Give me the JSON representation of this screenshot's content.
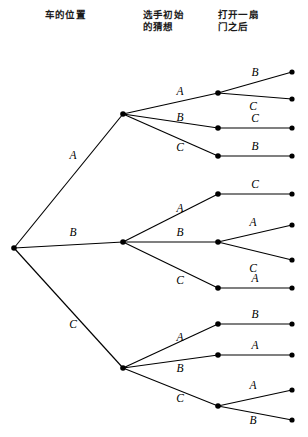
{
  "figure": {
    "width": 308,
    "height": 437,
    "background": "#ffffff",
    "line_color": "#000000",
    "node_color": "#000000"
  },
  "headers": [
    {
      "id": "hdr0",
      "text": "车的位置"
    },
    {
      "id": "hdr1",
      "text": "选手初始\n的猜想"
    },
    {
      "id": "hdr2",
      "text": "打开一扇\n门之后"
    }
  ],
  "chart_data": {
    "type": "diagram",
    "diagram_kind": "probability-tree",
    "levels": [
      "车的位置",
      "选手初始的猜想",
      "打开一扇门之后"
    ],
    "root": {
      "id": "root",
      "x": 14,
      "y": 248
    },
    "nodes": [
      {
        "id": "root",
        "x": 14,
        "y": 248,
        "level": 0,
        "label": ""
      },
      {
        "id": "A",
        "x": 123,
        "y": 114,
        "level": 1,
        "label": "A"
      },
      {
        "id": "B",
        "x": 123,
        "y": 242,
        "level": 1,
        "label": "B"
      },
      {
        "id": "C",
        "x": 123,
        "y": 368,
        "level": 1,
        "label": "C"
      },
      {
        "id": "A-A",
        "x": 218,
        "y": 93,
        "level": 2,
        "label": "A"
      },
      {
        "id": "A-B",
        "x": 218,
        "y": 128,
        "level": 2,
        "label": "B"
      },
      {
        "id": "A-C",
        "x": 218,
        "y": 156,
        "level": 2,
        "label": "C"
      },
      {
        "id": "B-A",
        "x": 218,
        "y": 194,
        "level": 2,
        "label": "A"
      },
      {
        "id": "B-B",
        "x": 218,
        "y": 242,
        "level": 2,
        "label": "B"
      },
      {
        "id": "B-C",
        "x": 218,
        "y": 288,
        "level": 2,
        "label": "C"
      },
      {
        "id": "C-A",
        "x": 218,
        "y": 324,
        "level": 2,
        "label": "A"
      },
      {
        "id": "C-B",
        "x": 218,
        "y": 355,
        "level": 2,
        "label": "B"
      },
      {
        "id": "C-C",
        "x": 218,
        "y": 406,
        "level": 2,
        "label": "C"
      },
      {
        "id": "A-A-B",
        "x": 292,
        "y": 72,
        "level": 3,
        "label": "B"
      },
      {
        "id": "A-A-C",
        "x": 292,
        "y": 99,
        "level": 3,
        "label": "C"
      },
      {
        "id": "A-B-C",
        "x": 292,
        "y": 128,
        "level": 3,
        "label": "C"
      },
      {
        "id": "A-C-B",
        "x": 292,
        "y": 156,
        "level": 3,
        "label": "B"
      },
      {
        "id": "B-A-C",
        "x": 292,
        "y": 194,
        "level": 3,
        "label": "C"
      },
      {
        "id": "B-B-A",
        "x": 292,
        "y": 225,
        "level": 3,
        "label": "A"
      },
      {
        "id": "B-B-C",
        "x": 292,
        "y": 260,
        "level": 3,
        "label": "C"
      },
      {
        "id": "B-C-A",
        "x": 292,
        "y": 288,
        "level": 3,
        "label": "A"
      },
      {
        "id": "C-A-B",
        "x": 292,
        "y": 324,
        "level": 3,
        "label": "B"
      },
      {
        "id": "C-B-A",
        "x": 292,
        "y": 355,
        "level": 3,
        "label": "A"
      },
      {
        "id": "C-C-A",
        "x": 292,
        "y": 390,
        "level": 3,
        "label": "A"
      },
      {
        "id": "C-C-B",
        "x": 292,
        "y": 420,
        "level": 3,
        "label": "B"
      }
    ],
    "edges": [
      {
        "from": "root",
        "to": "A",
        "label": "A",
        "lx": 73,
        "ly": 155
      },
      {
        "from": "root",
        "to": "B",
        "label": "B",
        "lx": 73,
        "ly": 232
      },
      {
        "from": "root",
        "to": "C",
        "label": "C",
        "lx": 73,
        "ly": 324
      },
      {
        "from": "A",
        "to": "A-A",
        "label": "A",
        "lx": 180,
        "ly": 91
      },
      {
        "from": "A",
        "to": "A-B",
        "label": "B",
        "lx": 180,
        "ly": 117
      },
      {
        "from": "A",
        "to": "A-C",
        "label": "C",
        "lx": 180,
        "ly": 147
      },
      {
        "from": "B",
        "to": "B-A",
        "label": "A",
        "lx": 180,
        "ly": 208
      },
      {
        "from": "B",
        "to": "B-B",
        "label": "B",
        "lx": 180,
        "ly": 232
      },
      {
        "from": "B",
        "to": "B-C",
        "label": "C",
        "lx": 180,
        "ly": 280
      },
      {
        "from": "C",
        "to": "C-A",
        "label": "A",
        "lx": 180,
        "ly": 337
      },
      {
        "from": "C",
        "to": "C-B",
        "label": "B",
        "lx": 180,
        "ly": 368
      },
      {
        "from": "C",
        "to": "C-C",
        "label": "C",
        "lx": 180,
        "ly": 398
      },
      {
        "from": "A-A",
        "to": "A-A-B",
        "label": "B",
        "lx": 255,
        "ly": 72
      },
      {
        "from": "A-A",
        "to": "A-A-C",
        "label": "C",
        "lx": 253,
        "ly": 106
      },
      {
        "from": "A-B",
        "to": "A-B-C",
        "label": "C",
        "lx": 255,
        "ly": 118
      },
      {
        "from": "A-C",
        "to": "A-C-B",
        "label": "B",
        "lx": 255,
        "ly": 146
      },
      {
        "from": "B-A",
        "to": "B-A-C",
        "label": "C",
        "lx": 255,
        "ly": 184
      },
      {
        "from": "B-B",
        "to": "B-B-A",
        "label": "A",
        "lx": 253,
        "ly": 222
      },
      {
        "from": "B-B",
        "to": "B-B-C",
        "label": "C",
        "lx": 253,
        "ly": 268
      },
      {
        "from": "B-C",
        "to": "B-C-A",
        "label": "A",
        "lx": 255,
        "ly": 278
      },
      {
        "from": "C-A",
        "to": "C-A-B",
        "label": "B",
        "lx": 255,
        "ly": 314
      },
      {
        "from": "C-B",
        "to": "C-B-A",
        "label": "A",
        "lx": 255,
        "ly": 345
      },
      {
        "from": "C-C",
        "to": "C-C-A",
        "label": "A",
        "lx": 253,
        "ly": 385
      },
      {
        "from": "C-C",
        "to": "C-C-B",
        "label": "B",
        "lx": 253,
        "ly": 420
      }
    ]
  }
}
